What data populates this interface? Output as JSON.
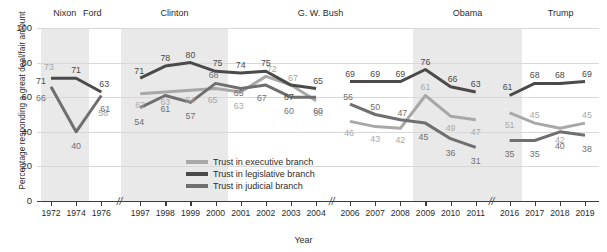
{
  "chart_data": {
    "type": "line",
    "title": "",
    "xlabel": "Year",
    "ylabel": "Percentage responding a great deal/fair amount",
    "ylim": [
      0,
      100
    ],
    "yticks": [
      0,
      20,
      40,
      60,
      80,
      100
    ],
    "grid": true,
    "legend_position": "inside-bottom-center",
    "x": [
      "1972",
      "1974",
      "1976",
      "1997",
      "1998",
      "1999",
      "2000",
      "2001",
      "2002",
      "2003",
      "2004",
      "2006",
      "2007",
      "2008",
      "2009",
      "2010",
      "2011",
      "2016",
      "2017",
      "2018",
      "2019"
    ],
    "axis_breaks": [
      "1976-1997",
      "2004-2006",
      "2011-2016"
    ],
    "series": [
      {
        "name": "Trust in executive branch",
        "color": "#a8a8a8",
        "values": [
          73,
          null,
          58,
          62,
          63,
          64,
          65,
          63,
          72,
          67,
          58,
          46,
          43,
          42,
          61,
          49,
          47,
          51,
          45,
          42,
          45
        ]
      },
      {
        "name": "Trust in legislative branch",
        "color": "#4a4a4a",
        "values": [
          71,
          71,
          63,
          71,
          78,
          80,
          75,
          74,
          75,
          67,
          65,
          69,
          69,
          69,
          76,
          66,
          63,
          61,
          68,
          68,
          69
        ]
      },
      {
        "name": "Trust in judicial branch",
        "color": "#6f6f6f",
        "values": [
          66,
          40,
          61,
          54,
          61,
          57,
          68,
          65,
          67,
          60,
          60,
          56,
          50,
          47,
          45,
          36,
          31,
          35,
          35,
          40,
          38
        ]
      }
    ],
    "presidents": [
      {
        "name": "Nixon",
        "start": "1972",
        "end": "1974"
      },
      {
        "name": "Ford",
        "start": "1974",
        "end": "1976"
      },
      {
        "name": "Clinton",
        "start": "1997",
        "end": "2000"
      },
      {
        "name": "G. W. Bush",
        "start": "2001",
        "end": "2008"
      },
      {
        "name": "Obama",
        "start": "2009",
        "end": "2016"
      },
      {
        "name": "Trump",
        "start": "2017",
        "end": "2019"
      }
    ]
  }
}
